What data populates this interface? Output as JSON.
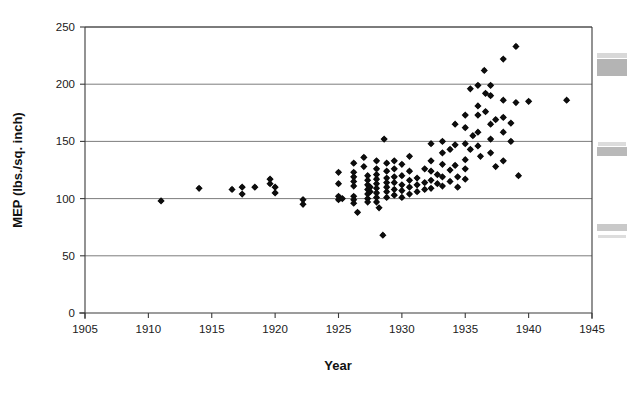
{
  "chart_data": {
    "type": "scatter",
    "title": "",
    "xlabel": "Year",
    "ylabel": "MEP (lbs./sq. inch)",
    "xlim": [
      1905,
      1945
    ],
    "ylim": [
      0,
      250
    ],
    "xticks": [
      1905,
      1910,
      1915,
      1920,
      1925,
      1930,
      1935,
      1940,
      1945
    ],
    "yticks": [
      0,
      50,
      100,
      150,
      200,
      250
    ],
    "xtick_labels": [
      "1905",
      "1910",
      "1915",
      "1920",
      "1925",
      "1930",
      "1935",
      "1940",
      "1945"
    ],
    "ytick_labels": [
      "0",
      "50",
      "100",
      "150",
      "200",
      "250"
    ],
    "grid": "horizontal",
    "legend": null,
    "marker": "filled-diamond",
    "marker_color": "#0d0d0d",
    "points": [
      [
        1911.0,
        98
      ],
      [
        1914.0,
        109
      ],
      [
        1916.6,
        108
      ],
      [
        1917.4,
        110
      ],
      [
        1917.4,
        104
      ],
      [
        1918.4,
        110
      ],
      [
        1919.6,
        117
      ],
      [
        1919.6,
        113
      ],
      [
        1920.0,
        110
      ],
      [
        1920.0,
        105
      ],
      [
        1922.2,
        99
      ],
      [
        1922.2,
        95
      ],
      [
        1925.0,
        123
      ],
      [
        1925.0,
        113
      ],
      [
        1925.0,
        102
      ],
      [
        1925.0,
        99
      ],
      [
        1925.3,
        100
      ],
      [
        1926.2,
        131
      ],
      [
        1926.2,
        123
      ],
      [
        1926.2,
        119
      ],
      [
        1926.2,
        115
      ],
      [
        1926.2,
        111
      ],
      [
        1926.2,
        102
      ],
      [
        1926.2,
        99
      ],
      [
        1926.2,
        96
      ],
      [
        1926.5,
        88
      ],
      [
        1927.0,
        136
      ],
      [
        1927.0,
        128
      ],
      [
        1927.3,
        120
      ],
      [
        1927.3,
        116
      ],
      [
        1927.3,
        112
      ],
      [
        1927.3,
        108
      ],
      [
        1927.3,
        104
      ],
      [
        1927.3,
        100
      ],
      [
        1927.3,
        97
      ],
      [
        1927.5,
        110
      ],
      [
        1927.5,
        106
      ],
      [
        1928.0,
        133
      ],
      [
        1928.0,
        126
      ],
      [
        1928.0,
        121
      ],
      [
        1928.0,
        117
      ],
      [
        1928.0,
        113
      ],
      [
        1928.0,
        109
      ],
      [
        1928.0,
        105
      ],
      [
        1928.0,
        101
      ],
      [
        1928.0,
        97
      ],
      [
        1928.2,
        92
      ],
      [
        1928.5,
        68
      ],
      [
        1928.6,
        152
      ],
      [
        1928.8,
        131
      ],
      [
        1928.8,
        124
      ],
      [
        1928.8,
        118
      ],
      [
        1928.8,
        114
      ],
      [
        1928.8,
        110
      ],
      [
        1928.8,
        106
      ],
      [
        1928.8,
        101
      ],
      [
        1929.4,
        133
      ],
      [
        1929.4,
        126
      ],
      [
        1929.4,
        119
      ],
      [
        1929.4,
        114
      ],
      [
        1929.4,
        108
      ],
      [
        1929.4,
        103
      ],
      [
        1930.0,
        130
      ],
      [
        1930.0,
        120
      ],
      [
        1930.0,
        112
      ],
      [
        1930.0,
        107
      ],
      [
        1930.0,
        101
      ],
      [
        1930.6,
        137
      ],
      [
        1930.6,
        124
      ],
      [
        1930.6,
        116
      ],
      [
        1930.6,
        110
      ],
      [
        1930.6,
        104
      ],
      [
        1931.2,
        118
      ],
      [
        1931.2,
        112
      ],
      [
        1931.2,
        106
      ],
      [
        1931.8,
        126
      ],
      [
        1931.8,
        114
      ],
      [
        1931.8,
        108
      ],
      [
        1932.3,
        148
      ],
      [
        1932.3,
        133
      ],
      [
        1932.3,
        124
      ],
      [
        1932.3,
        116
      ],
      [
        1932.3,
        109
      ],
      [
        1932.8,
        121
      ],
      [
        1932.8,
        113
      ],
      [
        1933.2,
        150
      ],
      [
        1933.2,
        140
      ],
      [
        1933.2,
        130
      ],
      [
        1933.2,
        119
      ],
      [
        1933.2,
        111
      ],
      [
        1933.8,
        143
      ],
      [
        1933.8,
        125
      ],
      [
        1933.8,
        115
      ],
      [
        1934.2,
        165
      ],
      [
        1934.2,
        147
      ],
      [
        1934.2,
        129
      ],
      [
        1934.4,
        119
      ],
      [
        1934.4,
        110
      ],
      [
        1935.0,
        173
      ],
      [
        1935.0,
        162
      ],
      [
        1935.0,
        148
      ],
      [
        1935.0,
        134
      ],
      [
        1935.0,
        126
      ],
      [
        1935.0,
        117
      ],
      [
        1935.4,
        196
      ],
      [
        1935.4,
        143
      ],
      [
        1935.6,
        155
      ],
      [
        1936.0,
        199
      ],
      [
        1936.0,
        181
      ],
      [
        1936.0,
        173
      ],
      [
        1936.0,
        158
      ],
      [
        1936.0,
        146
      ],
      [
        1936.2,
        137
      ],
      [
        1936.5,
        212
      ],
      [
        1936.6,
        192
      ],
      [
        1936.6,
        176
      ],
      [
        1937.0,
        199
      ],
      [
        1937.0,
        190
      ],
      [
        1937.0,
        165
      ],
      [
        1937.0,
        152
      ],
      [
        1937.0,
        140
      ],
      [
        1937.4,
        169
      ],
      [
        1937.4,
        128
      ],
      [
        1938.0,
        222
      ],
      [
        1938.0,
        186
      ],
      [
        1938.0,
        171
      ],
      [
        1938.0,
        158
      ],
      [
        1938.0,
        133
      ],
      [
        1938.6,
        166
      ],
      [
        1938.6,
        150
      ],
      [
        1939.0,
        233
      ],
      [
        1939.0,
        184
      ],
      [
        1939.2,
        120
      ],
      [
        1940.0,
        185
      ],
      [
        1943.0,
        186
      ]
    ]
  },
  "artifacts": {
    "label": "scanner-edge-marks",
    "blocks": [
      {
        "x": 597,
        "y": 53,
        "w": 30,
        "h": 5,
        "shade": "#d8d8d8"
      },
      {
        "x": 597,
        "y": 59,
        "w": 30,
        "h": 17,
        "shade": "#b4b4b4"
      },
      {
        "x": 598,
        "y": 142,
        "w": 28,
        "h": 4,
        "shade": "#dcdcdc"
      },
      {
        "x": 597,
        "y": 147,
        "w": 30,
        "h": 9,
        "shade": "#b9b9b9"
      },
      {
        "x": 597,
        "y": 224,
        "w": 30,
        "h": 7,
        "shade": "#c9c9c9"
      },
      {
        "x": 598,
        "y": 235,
        "w": 28,
        "h": 3,
        "shade": "#dddddd"
      }
    ]
  },
  "plot_geometry": {
    "left": 85,
    "right": 592,
    "top": 27,
    "bottom": 313
  }
}
